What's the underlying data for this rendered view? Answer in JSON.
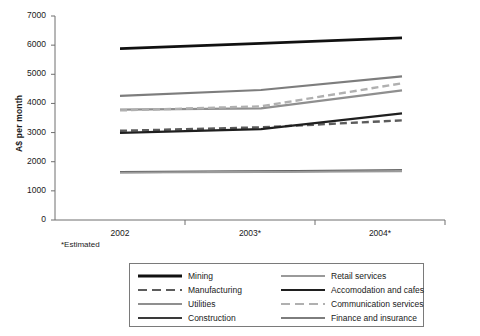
{
  "chart_data": {
    "type": "line",
    "title": "",
    "subtitle": "",
    "xlabel": "",
    "ylabel": "A$ per month",
    "categories": [
      "2002",
      "2003*",
      "2004*"
    ],
    "x_tick_labels": [
      "2002",
      "2003*",
      "2004*"
    ],
    "y_tick_labels": [
      "0",
      "1000",
      "2000",
      "3000",
      "4000",
      "5000",
      "6000",
      "7000"
    ],
    "y_ticks": [
      0,
      1000,
      2000,
      3000,
      4000,
      5000,
      6000,
      7000
    ],
    "ylim": [
      0,
      7000
    ],
    "grid": false,
    "legend_position": "bottom",
    "footnote": "*Estimated",
    "series": [
      {
        "name": "Mining",
        "values": [
          5880,
          6060,
          6250
        ],
        "color": "#111111",
        "style": "solid",
        "width": 2.6
      },
      {
        "name": "Manufacturing",
        "values": [
          3060,
          3180,
          3420
        ],
        "color": "#5c5c5c",
        "style": "dashed",
        "width": 2.4
      },
      {
        "name": "Utilities",
        "values": [
          3790,
          3830,
          4450
        ],
        "color": "#8f8f8f",
        "style": "solid",
        "width": 2.2
      },
      {
        "name": "Construction",
        "values": [
          1640,
          1670,
          1700
        ],
        "color": "#3a3a3a",
        "style": "solid",
        "width": 2.2
      },
      {
        "name": "Retail services",
        "values": [
          1630,
          1650,
          1680
        ],
        "color": "#9a9a9a",
        "style": "solid",
        "width": 2.2
      },
      {
        "name": "Accomodation and cafes",
        "values": [
          2990,
          3120,
          3660
        ],
        "color": "#1f1f1f",
        "style": "solid",
        "width": 2.2
      },
      {
        "name": "Communication services",
        "values": [
          3760,
          3900,
          4690
        ],
        "color": "#b0b0b0",
        "style": "dashed",
        "width": 2.4
      },
      {
        "name": "Finance and insurance",
        "values": [
          4260,
          4460,
          4930
        ],
        "color": "#7d7d7d",
        "style": "solid",
        "width": 2.2
      }
    ]
  },
  "legend": {
    "columns": [
      [
        {
          "label": "Mining",
          "series": 0
        },
        {
          "label": "Manufacturing",
          "series": 1
        },
        {
          "label": "Utilities",
          "series": 2
        },
        {
          "label": "Construction",
          "series": 3
        }
      ],
      [
        {
          "label": "Retail services",
          "series": 4
        },
        {
          "label": "Accomodation and cafes",
          "series": 5
        },
        {
          "label": "Communication services",
          "series": 6
        },
        {
          "label": "Finance and insurance",
          "series": 7
        }
      ]
    ]
  },
  "axes": {
    "plot_left": 55,
    "plot_right": 445,
    "plot_top": 16,
    "plot_bottom": 220,
    "data_left": 120,
    "data_right": 402,
    "axis_color": "#6e6e6e"
  }
}
